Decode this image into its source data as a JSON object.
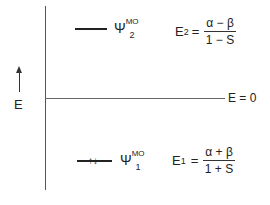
{
  "diagram": {
    "axis_label": "E",
    "zero_line_label": "E = 0",
    "levels": [
      {
        "name": "psi2",
        "psi_symbol": "Ψ",
        "psi_superscript": "MO",
        "psi_subscript": "2",
        "energy_symbol": "E",
        "energy_subscript": "2",
        "equals": "=",
        "numerator": "α − β",
        "denominator": "1 − S",
        "electrons": ""
      },
      {
        "name": "psi1",
        "psi_symbol": "Ψ",
        "psi_superscript": "MO",
        "psi_subscript": "1",
        "energy_symbol": "E",
        "energy_subscript": "1",
        "equals": "=",
        "numerator": "α + β",
        "denominator": "1 + S",
        "electrons": "↑↓"
      }
    ]
  }
}
